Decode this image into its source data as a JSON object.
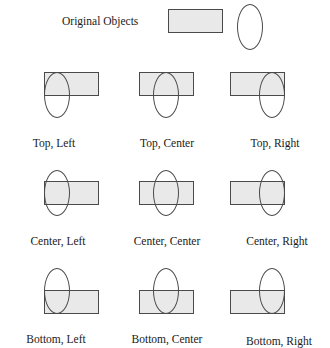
{
  "figure": {
    "header": {
      "label": "Original Objects",
      "objects": [
        {
          "shape": "rectangle",
          "width": 55,
          "height": 24,
          "fill": "#e9e9e9",
          "stroke": "#4a4a4a"
        },
        {
          "shape": "ellipse",
          "width": 26,
          "height": 46,
          "fill": "none",
          "stroke": "#4a4a4a"
        }
      ]
    },
    "grid": {
      "rows": 3,
      "columns": 3,
      "vertical_alignments": [
        "Top",
        "Center",
        "Bottom"
      ],
      "horizontal_alignments": [
        "Left",
        "Center",
        "Right"
      ],
      "cells": [
        {
          "label": "Top, Left",
          "vertical": "Top",
          "horizontal": "Left"
        },
        {
          "label": "Top, Center",
          "vertical": "Top",
          "horizontal": "Center"
        },
        {
          "label": "Top, Right",
          "vertical": "Top",
          "horizontal": "Right"
        },
        {
          "label": "Center, Left",
          "vertical": "Center",
          "horizontal": "Left"
        },
        {
          "label": "Center, Center",
          "vertical": "Center",
          "horizontal": "Center"
        },
        {
          "label": "Center, Right",
          "vertical": "Center",
          "horizontal": "Right"
        },
        {
          "label": "Bottom, Left",
          "vertical": "Bottom",
          "horizontal": "Left"
        },
        {
          "label": "Bottom, Center",
          "vertical": "Bottom",
          "horizontal": "Center"
        },
        {
          "label": "Bottom, Right",
          "vertical": "Bottom",
          "horizontal": "Right"
        }
      ]
    },
    "colors": {
      "rectangle_fill": "#e9e9e9",
      "stroke": "#4a4a4a",
      "background": "#ffffff",
      "text": "#1a1a1a"
    }
  }
}
